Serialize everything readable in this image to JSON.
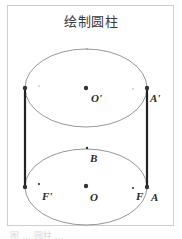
{
  "diagram": {
    "title": "绘制圆柱",
    "caption": "图 … 圆柱 …",
    "colors": {
      "frame": "#cfcfcf",
      "ellipse": "#8a8a8a",
      "generatrix": "#222222",
      "point": "#333333",
      "label": "#2a2a2a"
    },
    "labels": {
      "O_prime": "O'",
      "A_prime": "A'",
      "B": "B",
      "F_prime": "F'",
      "O": "O",
      "F": "F",
      "A": "A"
    },
    "shapes": {
      "top_ellipse": {
        "cx": 86,
        "cy": 88,
        "rx": 61,
        "ry": 39
      },
      "bottom_ellipse": {
        "cx": 86,
        "cy": 187,
        "rx": 61,
        "ry": 38
      },
      "left_generatrix": {
        "x": 25,
        "y1": 88,
        "y2": 187
      },
      "right_generatrix": {
        "x": 147,
        "y1": 88,
        "y2": 187
      }
    }
  }
}
